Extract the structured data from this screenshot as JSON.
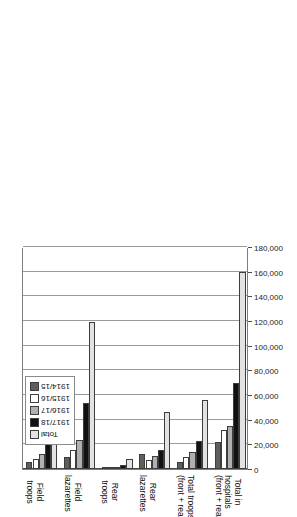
{
  "chart_data": {
    "type": "bar",
    "orientation": "horizontal",
    "title": "",
    "xlabel": "",
    "ylabel": "",
    "grid": true,
    "legend_position": "bottom-left",
    "xlim": [
      0,
      180000
    ],
    "ticks": [
      "180,000",
      "160,000",
      "140,000",
      "120,000",
      "100,000",
      "80,000",
      "60,000",
      "40,000",
      "20,000",
      "0"
    ],
    "tick_values": [
      180000,
      160000,
      140000,
      120000,
      100000,
      80000,
      60000,
      40000,
      20000,
      0
    ],
    "categories": [
      "Field\ntroops",
      "Field\nlazarettes",
      "Rear\ntroops",
      "Rear\nlazarettes",
      "Total troops\n(front + rear)",
      "Total in\nhospitals\n(front + rear)"
    ],
    "series": [
      {
        "name": "1914/15",
        "color": "#5e5e5e",
        "values": [
          5500,
          9500,
          400,
          12500,
          6000,
          22000
        ]
      },
      {
        "name": "1915/16",
        "color": "#ffffff",
        "values": [
          8500,
          15500,
          900,
          7500,
          9500,
          31500
        ]
      },
      {
        "name": "1916/17",
        "color": "#b0b0b0",
        "values": [
          12500,
          23500,
          1400,
          10500,
          14000,
          34500
        ]
      },
      {
        "name": "1917/18",
        "color": "#111111",
        "values": [
          21500,
          53500,
          3000,
          15500,
          22500,
          69500
        ]
      },
      {
        "name": "Total",
        "color": "#e2e2e2",
        "values": [
          48000,
          119000,
          8000,
          46000,
          56000,
          160000
        ]
      }
    ]
  },
  "legend": {
    "items": [
      {
        "label": "1914/15",
        "color": "#5e5e5e"
      },
      {
        "label": "1915/16",
        "color": "#ffffff"
      },
      {
        "label": "1916/17",
        "color": "#b0b0b0"
      },
      {
        "label": "1917/18",
        "color": "#111111"
      },
      {
        "label": "Total",
        "color": "#e2e2e2"
      }
    ]
  }
}
